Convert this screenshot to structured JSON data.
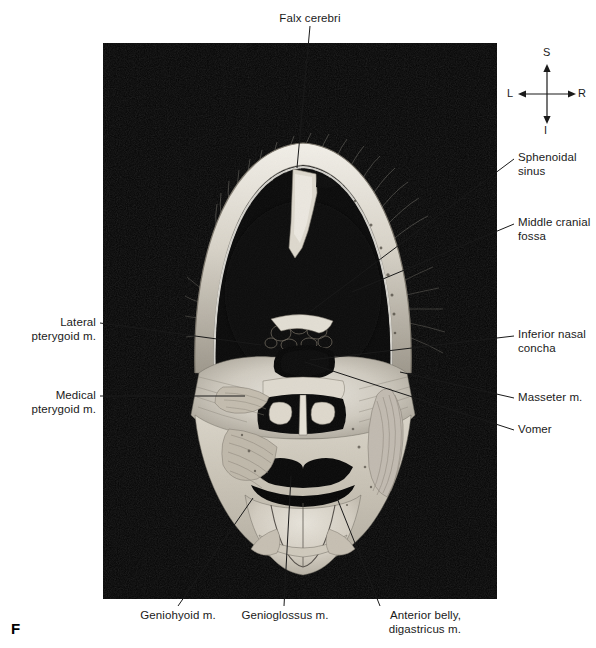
{
  "figure": {
    "panel_letter": "F",
    "photo": {
      "alt_description": "Coronal section of the human head, black background, cadaver cross-section showing calvaria, cranial cavity, nasal cavity, maxilla, mandible and tongue",
      "background_color": "#000000"
    }
  },
  "compass": {
    "name": "orientation-compass",
    "superior": "S",
    "inferior": "I",
    "left": "L",
    "right": "R"
  },
  "labels": {
    "top": [
      {
        "id": "falx-cerebri",
        "text": "Falx cerebri"
      }
    ],
    "right": [
      {
        "id": "sphenoidal-sinus",
        "text": "Sphenoidal\nsinus"
      },
      {
        "id": "middle-cranial-fossa",
        "text": "Middle cranial\nfossa"
      },
      {
        "id": "inferior-nasal-concha",
        "text": "Inferior nasal\nconcha"
      },
      {
        "id": "masseter-m",
        "text": "Masseter m."
      },
      {
        "id": "vomer",
        "text": "Vomer"
      }
    ],
    "left": [
      {
        "id": "lateral-pterygoid-m",
        "text": "Lateral\npterygoid m."
      },
      {
        "id": "medical-pterygoid-m",
        "text": "Medical\npterygoid m."
      }
    ],
    "bottom": [
      {
        "id": "geniohyoid-m",
        "text": "Geniohyoid m."
      },
      {
        "id": "genioglossus-m",
        "text": "Genioglossus m."
      },
      {
        "id": "anterior-belly-digastricus-m",
        "text": "Anterior belly,\ndigastricus m."
      }
    ]
  },
  "colors": {
    "leader_line": "#1a1a1a",
    "text": "#1a1a1a",
    "page_background": "#ffffff"
  }
}
